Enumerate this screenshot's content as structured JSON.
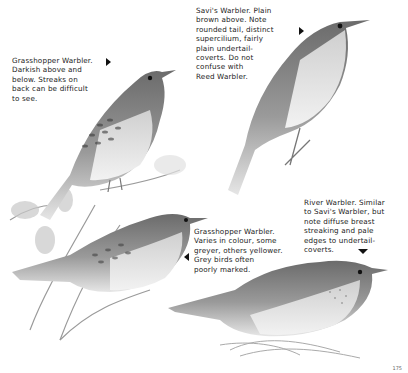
{
  "page": {
    "page_number": "175"
  },
  "captions": [
    {
      "id": "grasshopper-1",
      "text": "Grasshopper Warbler.\nDarkish above and\nbelow. Streaks on\nback can be difficult\nto see.",
      "pointer": "right"
    },
    {
      "id": "savis",
      "text": "Savi's Warbler. Plain\nbrown above. Note\nrounded tail, distinct\nsupercilium, fairly\nplain undertail-\ncoverts. Do not\nconfuse with\nReed Warbler.",
      "pointer": "right"
    },
    {
      "id": "grasshopper-2",
      "text": "Grasshopper Warbler.\nVaries in colour, some\ngreyer, others yellower.\nGrey birds often\npoorly marked.",
      "pointer": "left"
    },
    {
      "id": "river",
      "text": "River Warbler. Similar\nto Savi's Warbler, but\nnote diffuse breast\nstreaking and pale\nedges to undertail-\ncoverts.",
      "pointer": "down"
    }
  ],
  "illustrations": [
    {
      "name": "grasshopper-warbler-perched-upper",
      "species": "Grasshopper Warbler"
    },
    {
      "name": "savis-warbler",
      "species": "Savi's Warbler"
    },
    {
      "name": "grasshopper-warbler-perched-lower",
      "species": "Grasshopper Warbler"
    },
    {
      "name": "river-warbler",
      "species": "River Warbler"
    }
  ],
  "colors": {
    "ink": "#222222",
    "bird_dark": "#5a5a5a",
    "bird_mid": "#8a8a8a",
    "bird_light": "#d8d8d8"
  }
}
